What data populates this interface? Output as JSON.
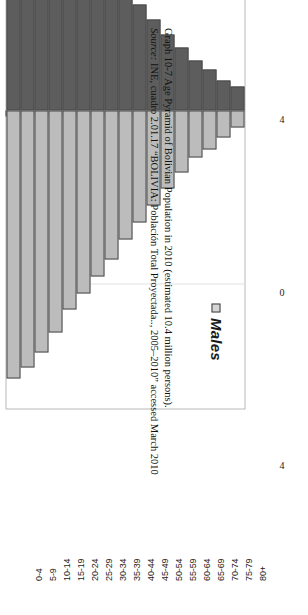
{
  "figure": {
    "caption_line1": "Graph 10-7 Age Pyramid of Bolivian Population in 2010 (estimated 10.4 million persons).",
    "caption_source_word": "Source:",
    "caption_line2": " INE, cuadro 2.01.17 “BOLIVIA: Población Total Proyectada.., 2005–2010” accessed March 2010"
  },
  "legend": {
    "females": "Females",
    "males": "Males"
  },
  "value_axis": {
    "labels": [
      "8",
      "4",
      "0",
      "4",
      "8"
    ]
  },
  "colors": {
    "female_bar": "#5d5d5d",
    "male_bar": "#bcbcbc",
    "bar_outline": "#4a4a4a",
    "axis": "#3a3a3a",
    "frame": "#b9b9b9",
    "gridline": "#e2e2e2",
    "page": "#ffffff"
  },
  "chart_data": {
    "type": "bar",
    "title": "Age Pyramid of Bolivian Population in 2010 (estimated 10.4 million persons)",
    "subtitle": "",
    "xlabel": "",
    "ylabel": "",
    "orientation": "horizontal-pyramid-rotated",
    "categories": [
      "80+",
      "75-79",
      "70-74",
      "65-69",
      "60-64",
      "55-59",
      "50-54",
      "45-49",
      "40-44",
      "35-39",
      "30-34",
      "25-29",
      "20-24",
      "15-19",
      "10-14",
      "5-9",
      "0-4"
    ],
    "series": [
      {
        "name": "Females",
        "values": [
          0.55,
          0.7,
          0.95,
          1.15,
          1.45,
          1.75,
          2.1,
          2.45,
          2.85,
          3.25,
          3.6,
          4.0,
          4.4,
          5.0,
          5.55,
          6.05,
          6.55
        ]
      },
      {
        "name": "Males",
        "values": [
          0.4,
          0.62,
          0.9,
          1.1,
          1.45,
          1.8,
          2.2,
          2.6,
          3.0,
          3.45,
          3.85,
          4.25,
          4.6,
          5.15,
          5.6,
          5.95,
          6.2
        ]
      }
    ],
    "value_ticks": [
      8,
      4,
      0,
      4,
      8
    ],
    "xlim": [
      8,
      8
    ],
    "grid": true,
    "legend_position": "inside-upper-left"
  }
}
